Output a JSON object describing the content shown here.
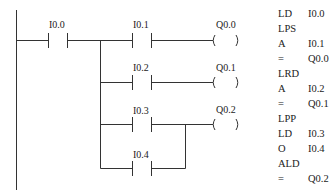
{
  "ladder": {
    "rungs": [
      {
        "contact": "I0.0",
        "coil": null
      },
      {
        "contact": "I0.1",
        "coil": "Q0.0"
      },
      {
        "contact": "I0.2",
        "coil": "Q0.1"
      },
      {
        "contact": "I0.3",
        "coil": "Q0.2"
      },
      {
        "contact": "I0.4",
        "coil": null
      }
    ],
    "contacts": {
      "c0": "I0.0",
      "c1": "I0.1",
      "c2": "I0.2",
      "c3": "I0.3",
      "c4": "I0.4"
    },
    "coils": {
      "q0": "Q0.0",
      "q1": "Q0.1",
      "q2": "Q0.2"
    },
    "colors": {
      "line": "#333333",
      "text": "#222222",
      "background": "#ffffff"
    }
  },
  "instruction_list": [
    {
      "op": "LD",
      "arg": "I0.0"
    },
    {
      "op": "LPS",
      "arg": ""
    },
    {
      "op": "A",
      "arg": "I0.1"
    },
    {
      "op": "=",
      "arg": "Q0.0"
    },
    {
      "op": "LRD",
      "arg": ""
    },
    {
      "op": "A",
      "arg": "I0.2"
    },
    {
      "op": "=",
      "arg": "Q0.1"
    },
    {
      "op": "LPP",
      "arg": ""
    },
    {
      "op": "LD",
      "arg": "I0.3"
    },
    {
      "op": "O",
      "arg": "I0.4"
    },
    {
      "op": "ALD",
      "arg": ""
    },
    {
      "op": "=",
      "arg": "Q0.2"
    }
  ]
}
